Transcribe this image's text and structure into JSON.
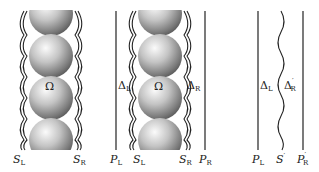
{
  "figure": {
    "panels": [
      {
        "id": "panel-1",
        "region_label": "Ω",
        "bottom_labels": [
          {
            "main": "S",
            "sub": "L",
            "prime": ""
          },
          {
            "main": "S",
            "sub": "R",
            "prime": ""
          }
        ]
      },
      {
        "id": "panel-2",
        "region_label": "Ω",
        "gap_labels": [
          {
            "main": "Δ",
            "sub": "L",
            "prime": ""
          },
          {
            "main": "Δ",
            "sub": "R",
            "prime": ""
          }
        ],
        "bottom_labels": [
          {
            "main": "P",
            "sub": "L",
            "prime": ""
          },
          {
            "main": "S",
            "sub": "L",
            "prime": ""
          },
          {
            "main": "S",
            "sub": "R",
            "prime": ""
          },
          {
            "main": "P",
            "sub": "R",
            "prime": ""
          }
        ]
      },
      {
        "id": "panel-3",
        "gap_labels": [
          {
            "main": "Δ",
            "sub": "L",
            "prime": ""
          },
          {
            "main": "Δ",
            "sub": "R",
            "prime": "′"
          }
        ],
        "bottom_labels": [
          {
            "main": "P",
            "sub": "L",
            "prime": ""
          },
          {
            "main": "S",
            "sub": "",
            "prime": "′"
          },
          {
            "main": "P",
            "sub": "R",
            "prime": "′"
          }
        ]
      }
    ],
    "colors": {
      "line": "#222222",
      "sphere_light": "#fbfbfb",
      "sphere_mid": "#b5b5b5",
      "sphere_dark": "#5a5a5a"
    }
  }
}
